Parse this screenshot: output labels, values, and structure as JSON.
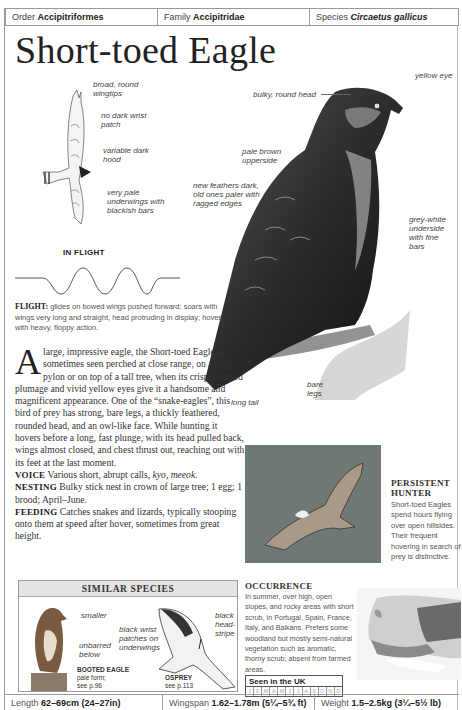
{
  "taxonomy": {
    "order_label": "Order",
    "order_value": "Accipitriformes",
    "family_label": "Family",
    "family_value": "Accipitridae",
    "species_label": "Species",
    "species_value": "Circaetus gallicus"
  },
  "title": "Short-toed Eagle",
  "flight_illustration": {
    "labels": [
      "broad, round wingtips",
      "no dark wrist patch",
      "variable dark hood",
      "very pale underwings with blackish bars"
    ],
    "caption": "IN FLIGHT"
  },
  "flight_text": {
    "label": "FLIGHT:",
    "body": "glides on bowed wings pushed forward; soars with wings very long and straight, head protruding in display; hovers with heavy, floppy action."
  },
  "main_illustration": {
    "labels": {
      "bulky_head": "bulky, round head",
      "yellow_eye": "yellow eye",
      "upperside": "pale brown upperside",
      "feathers": "new feathers dark, old ones paler with ragged edges",
      "underside": "grey-white underside with fine bars",
      "legs": "bare legs",
      "tail": "long tail"
    }
  },
  "description": {
    "dropcap": "A",
    "intro": "large, impressive eagle, the Short-toed Eagle is sometimes seen perched at close range, on a high pylon or on top of a tall tree, when its crisply barred plumage and vivid yellow eyes give it a handsome and magnificent appearance. One of the “snake-eagles”, this bird of prey has strong, bare legs, a thickly feathered, rounded head, and an owl-like face. While hunting it hovers before a long, fast plunge, with its head pulled back, wings almost closed, and chest thrust out, reaching out with its feet at the last moment.",
    "voice_label": "VOICE",
    "voice_text": "Various short, abrupt calls,",
    "voice_calls": "kyo, meeok.",
    "nesting_label": "NESTING",
    "nesting_text": "Bulky stick nest in crown of large tree; 1 egg; 1 brood; April–June.",
    "feeding_label": "FEEDING",
    "feeding_text": "Catches snakes and lizards, typically stooping onto them at speed after hover, sometimes from great height."
  },
  "photo_caption": {
    "heading": "PERSISTENT HUNTER",
    "text": "Short-toed Eagles spend hours flying over open hillsides. Their frequent hovering in search of prey is distinctive."
  },
  "similar_species": {
    "heading": "SIMILAR SPECIES",
    "booted": {
      "labels": [
        "smaller",
        "unbarred below"
      ],
      "name": "BOOTED EAGLE",
      "note": "pale form;",
      "ref": "see p.96"
    },
    "osprey": {
      "labels": [
        "black wrist patches on underwings",
        "black head-stripe"
      ],
      "name": "OSPREY",
      "ref": "see p.113"
    }
  },
  "occurrence": {
    "heading": "OCCURRENCE",
    "text": "In summer, over high, open slopes, and rocky areas with short scrub, in Portugal, Spain, France, Italy, and Balkans. Prefers some woodland but mostly semi-natural vegetation such as aromatic, thorny scrub; absent from farmed areas."
  },
  "seen_in_uk": {
    "heading": "Seen in the UK",
    "months": [
      "J",
      "F",
      "M",
      "A",
      "M",
      "J",
      "J",
      "A",
      "S",
      "O",
      "N",
      "D"
    ]
  },
  "measurements": {
    "length_label": "Length",
    "length_value": "62–69cm (24–27in)",
    "wingspan_label": "Wingspan",
    "wingspan_value": "1.62–1.78m (5¼–5¾ ft)",
    "weight_label": "Weight",
    "weight_value": "1.5–2.5kg (3¼–5½ lb)"
  },
  "colors": {
    "border": "#999999",
    "header_band": "#e3e3e3",
    "text": "#222222",
    "photo_bg": "#6e7874"
  }
}
